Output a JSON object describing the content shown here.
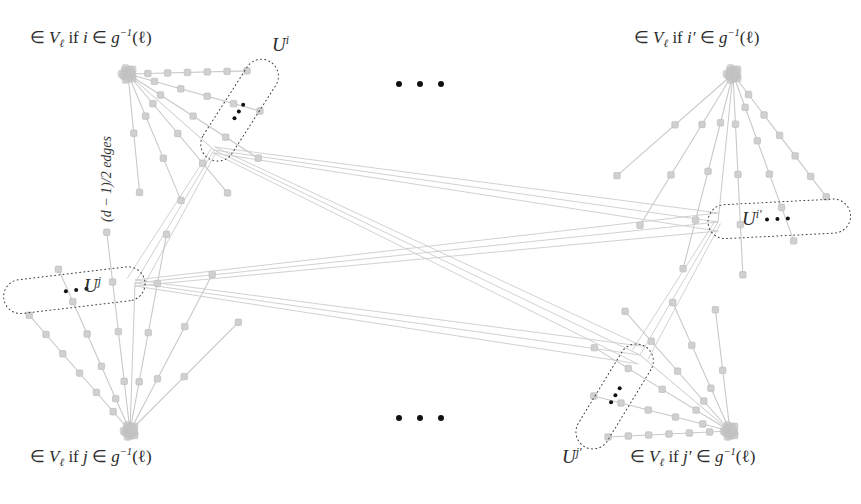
{
  "figure": {
    "type": "graph-gadget-diagram",
    "width": 861,
    "height": 504,
    "background": "#ffffff",
    "colors": {
      "gadget_edge": "#c9c9c9",
      "gadget_node": "#d0d0d0",
      "gadget_node_stroke": "#bcbcbc",
      "cluster_node": "#c4c4c4",
      "cross_edge": "#cccccc",
      "dotted_outline": "#3a3a3a",
      "ellipsis_dot": "#111111",
      "text": "#2b2b2b"
    }
  },
  "labels": {
    "top_left_condition": {
      "text": "∈ V_ℓ if i ∈ g^{-1}(ℓ)",
      "parts": {
        "in": "∈",
        "v": "V",
        "sub": "ℓ",
        "if": "if",
        "index": "i",
        "in2": "∈",
        "g": "g",
        "exp": "−1",
        "arg": "(ℓ)"
      }
    },
    "top_right_condition": {
      "text": "∈ V_ℓ if i′ ∈ g^{-1}(ℓ)",
      "parts": {
        "in": "∈",
        "v": "V",
        "sub": "ℓ",
        "if": "if",
        "index": "i′",
        "in2": "∈",
        "g": "g",
        "exp": "−1",
        "arg": "(ℓ)"
      }
    },
    "bottom_left_condition": {
      "text": "∈ V_ℓ if j ∈ g^{-1}(ℓ)",
      "parts": {
        "in": "∈",
        "v": "V",
        "sub": "ℓ",
        "if": "if",
        "index": "j",
        "in2": "∈",
        "g": "g",
        "exp": "−1",
        "arg": "(ℓ)"
      }
    },
    "bottom_right_condition": {
      "text": "∈ V_ℓ if j′ ∈ g^{-1}(ℓ)",
      "parts": {
        "in": "∈",
        "v": "V",
        "sub": "ℓ",
        "if": "if",
        "index": "j′",
        "in2": "∈",
        "g": "g",
        "exp": "−1",
        "arg": "(ℓ)"
      }
    },
    "edge_count": {
      "text": "(d − 1)/2 edges",
      "base": "(d − 1)/2 edges"
    },
    "u_i": {
      "base": "U",
      "sup": "i"
    },
    "u_i_prime": {
      "base": "U",
      "sup": "i′"
    },
    "u_j": {
      "base": "U",
      "sup": "j"
    },
    "u_j_prime": {
      "base": "U",
      "sup": "j′"
    }
  },
  "gadgets": [
    {
      "id": "gadget-i",
      "name": "U^i",
      "corner": {
        "x": 128,
        "y": 74
      },
      "hub": {
        "x": 214,
        "y": 150
      },
      "paths": 6,
      "nodes_per_path": [
        5,
        4,
        3,
        3,
        2,
        1
      ],
      "ellipsis_dots": 3
    },
    {
      "id": "gadget-i-prime",
      "name": "U^{i'}",
      "corner": {
        "x": 733,
        "y": 74
      },
      "hub": {
        "x": 718,
        "y": 222
      },
      "paths": 6,
      "nodes_per_path": [
        5,
        4,
        3,
        3,
        2,
        1
      ],
      "ellipsis_dots": 3
    },
    {
      "id": "gadget-j",
      "name": "U^j",
      "corner": {
        "x": 130,
        "y": 431
      },
      "hub": {
        "x": 135,
        "y": 283
      },
      "paths": 6,
      "nodes_per_path": [
        5,
        4,
        3,
        3,
        2,
        1
      ],
      "ellipsis_dots": 3
    },
    {
      "id": "gadget-j-prime",
      "name": "U^{j'}",
      "corner": {
        "x": 730,
        "y": 431
      },
      "hub": {
        "x": 640,
        "y": 355
      },
      "paths": 6,
      "nodes_per_path": [
        5,
        4,
        3,
        3,
        2,
        1
      ],
      "ellipsis_dots": 3
    }
  ],
  "ellipses_middle": [
    {
      "id": "top-middle-dots",
      "cx": 420,
      "cy": 84,
      "count": 3,
      "spacing": 21
    },
    {
      "id": "bottom-middle-dots",
      "cx": 420,
      "cy": 418,
      "count": 3,
      "spacing": 21
    }
  ],
  "cross_connections": {
    "description": "fan bundles between gadget hubs",
    "pairs": [
      [
        "gadget-i",
        "gadget-i-prime"
      ],
      [
        "gadget-i",
        "gadget-j-prime"
      ],
      [
        "gadget-j",
        "gadget-i-prime"
      ],
      [
        "gadget-j",
        "gadget-j-prime"
      ],
      [
        "gadget-i",
        "gadget-j"
      ],
      [
        "gadget-i-prime",
        "gadget-j-prime"
      ]
    ],
    "bundle_size": 3
  }
}
